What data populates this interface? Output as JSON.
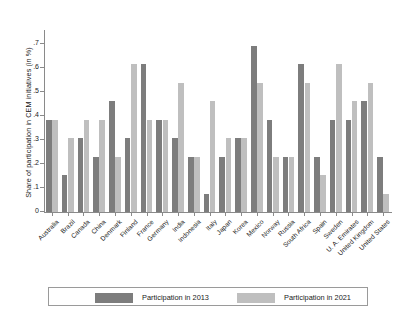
{
  "chart_data": {
    "type": "bar",
    "title": "",
    "subtitle": "",
    "xlabel": "",
    "ylabel": "Share of participation in CEM initiatives (in %)",
    "ylim": [
      0,
      0.75
    ],
    "yticks": [
      "0",
      ".1",
      ".2",
      ".3",
      ".4",
      ".5",
      ".6",
      ".7"
    ],
    "ytick_values": [
      0,
      0.1,
      0.2,
      0.3,
      0.4,
      0.5,
      0.6,
      0.7
    ],
    "grid": false,
    "legend_position": "bottom",
    "categories": [
      "Australia",
      "Brazil",
      "Canada",
      "China",
      "Denmark",
      "Finland",
      "France",
      "Germany",
      "India",
      "Indonesia",
      "Italy",
      "Japan",
      "Korea",
      "Mexico",
      "Norway",
      "Russia",
      "South Africa",
      "Spain",
      "Sweden",
      "U. A. Emirates",
      "United Kingdom",
      "United States"
    ],
    "series": [
      {
        "name": "Participation in 2013",
        "color": "#7d7d7d",
        "values": [
          0.385,
          0.154,
          0.308,
          0.231,
          0.462,
          0.308,
          0.615,
          0.385,
          0.308,
          0.231,
          0.077,
          0.231,
          0.308,
          0.692,
          0.385,
          0.231,
          0.615,
          0.231,
          0.385,
          0.385,
          0.462,
          0.231
        ]
      },
      {
        "name": "Participation in 2021",
        "color": "#bfbfbf",
        "values": [
          0.385,
          0.308,
          0.385,
          0.385,
          0.231,
          0.615,
          0.385,
          0.385,
          0.538,
          0.231,
          0.462,
          0.308,
          0.308,
          0.538,
          0.231,
          0.231,
          0.538,
          0.154,
          0.615,
          0.462,
          0.538,
          0.077
        ]
      }
    ]
  },
  "legend": {
    "items": [
      {
        "label": "Participation in 2013",
        "color": "#7d7d7d"
      },
      {
        "label": "Participation in 2021",
        "color": "#bfbfbf"
      }
    ]
  }
}
